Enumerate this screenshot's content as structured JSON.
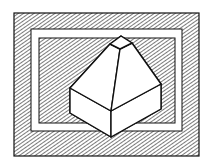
{
  "figure": {
    "colors": {
      "background": "#ffffff",
      "ink": "#111111",
      "hatch": "#333333",
      "solid_face": "#ffffff"
    },
    "frame": {
      "outer": {
        "x": 14,
        "y": 13,
        "w": 185,
        "h": 143
      },
      "white_band": {
        "x": 31,
        "y": 29,
        "w": 151,
        "h": 102
      },
      "inner_hatched": {
        "x": 39,
        "y": 38,
        "w": 136,
        "h": 85
      }
    },
    "solid": {
      "cap": {
        "apex": [
          121,
          36
        ],
        "left": [
          110,
          44
        ],
        "right": [
          132,
          43
        ],
        "front": [
          120,
          49
        ]
      },
      "base_top": {
        "left": [
          70,
          88
        ],
        "front": [
          111,
          111
        ],
        "right": [
          161,
          84
        ]
      },
      "base_bottom": {
        "left": [
          70,
          113
        ],
        "front": [
          111,
          137
        ],
        "right": [
          161,
          109
        ]
      }
    }
  }
}
